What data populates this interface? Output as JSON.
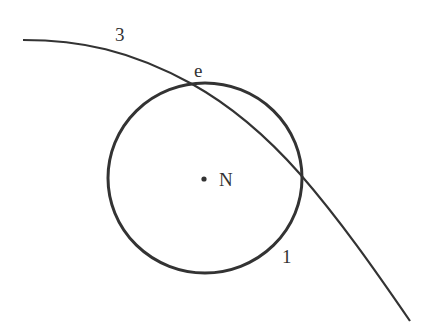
{
  "diagram": {
    "labels": {
      "curve": "3",
      "intersection": "e",
      "center": "N",
      "circle": "1"
    },
    "colors": {
      "stroke": "#333333",
      "background": "#ffffff"
    }
  }
}
